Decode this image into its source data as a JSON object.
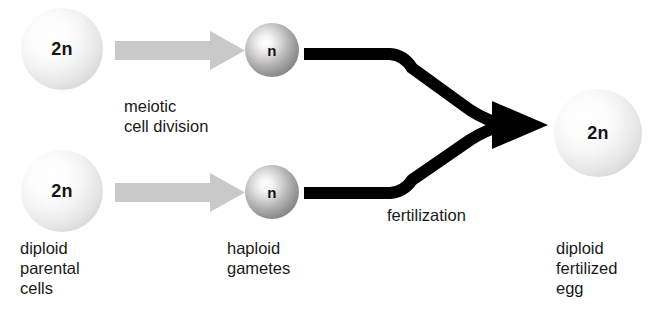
{
  "diagram": {
    "background_color": "#ffffff",
    "width": 653,
    "height": 329
  },
  "cells": {
    "top_parent": {
      "ploidy_label": "2n",
      "type": "diploid",
      "fill": "#e6e6e6"
    },
    "bottom_parent": {
      "ploidy_label": "2n",
      "type": "diploid",
      "fill": "#e6e6e6"
    },
    "top_gamete": {
      "ploidy_label": "n",
      "type": "haploid",
      "fill": "#949494"
    },
    "bottom_gamete": {
      "ploidy_label": "n",
      "type": "haploid",
      "fill": "#949494"
    },
    "zygote": {
      "ploidy_label": "2n",
      "type": "diploid",
      "fill": "#e6e6e6"
    }
  },
  "arrows": {
    "meiosis_top": {
      "style": "gray-block-arrow",
      "color": "#c9c9c9"
    },
    "meiosis_bottom": {
      "style": "gray-block-arrow",
      "color": "#c9c9c9"
    },
    "fertilization": {
      "style": "black-converging-arrow",
      "color": "#000000"
    }
  },
  "labels": {
    "meiosis": "meiotic\ncell division",
    "parental_cells": "diploid\nparental\ncells",
    "haploid_gametes": "haploid\ngametes",
    "fertilization": "fertilization",
    "fertilized_egg": "diploid\nfertilized\negg"
  }
}
